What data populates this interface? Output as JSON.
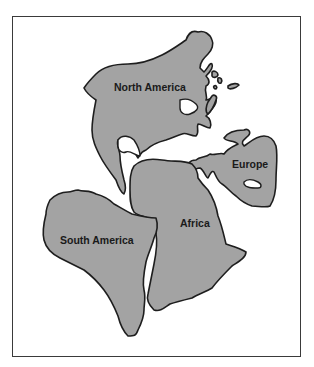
{
  "map": {
    "type": "continental-drift-reconstruction",
    "colors": {
      "land": "#a3a3a3",
      "outline": "#1e1e1e",
      "ocean": "#ffffff",
      "frame": "#3a3a3a"
    },
    "labels": {
      "north_america": "North America",
      "europe": "Europe",
      "africa": "Africa",
      "south_america": "South America"
    }
  }
}
